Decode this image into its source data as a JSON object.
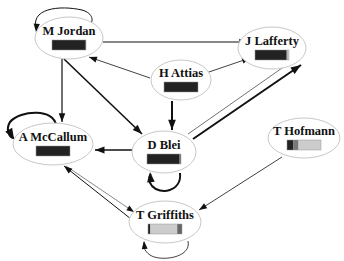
{
  "diagram": {
    "type": "directed-graph",
    "colors": {
      "node_fill": "#ffffff",
      "node_stroke": "#c8c8c8",
      "edge": "#111111",
      "bar_dark": "#222222",
      "bar_mid": "#666666",
      "bar_light": "#c8c8c8"
    },
    "nodes": [
      {
        "id": "jordan",
        "label": "M Jordan",
        "cx": 69,
        "cy": 38,
        "rx": 34,
        "ry": 21,
        "bar": [
          {
            "w": 0.97,
            "c": "#222222"
          },
          {
            "w": 0.03,
            "c": "#555555"
          }
        ]
      },
      {
        "id": "lafferty",
        "label": "J Lafferty",
        "cx": 272,
        "cy": 48,
        "rx": 34,
        "ry": 21,
        "bar": [
          {
            "w": 0.93,
            "c": "#222222"
          },
          {
            "w": 0.03,
            "c": "#777777"
          },
          {
            "w": 0.04,
            "c": "#cccccc"
          }
        ]
      },
      {
        "id": "attias",
        "label": "H Attias",
        "cx": 181,
        "cy": 80,
        "rx": 30,
        "ry": 20,
        "bar": [
          {
            "w": 1.0,
            "c": "#222222"
          }
        ]
      },
      {
        "id": "mccallum",
        "label": "A McCallum",
        "cx": 53,
        "cy": 144,
        "rx": 40,
        "ry": 21,
        "bar": [
          {
            "w": 1.0,
            "c": "#222222"
          }
        ]
      },
      {
        "id": "blei",
        "label": "D Blei",
        "cx": 164,
        "cy": 152,
        "rx": 32,
        "ry": 21,
        "bar": [
          {
            "w": 0.96,
            "c": "#222222"
          },
          {
            "w": 0.04,
            "c": "#777777"
          }
        ]
      },
      {
        "id": "hofmann",
        "label": "T Hofmann",
        "cx": 304,
        "cy": 138,
        "rx": 36,
        "ry": 20,
        "bar": [
          {
            "w": 0.18,
            "c": "#222222"
          },
          {
            "w": 0.16,
            "c": "#777777"
          },
          {
            "w": 0.66,
            "c": "#cccccc"
          }
        ]
      },
      {
        "id": "griffiths",
        "label": "T Griffiths",
        "cx": 165,
        "cy": 222,
        "rx": 36,
        "ry": 21,
        "bar": [
          {
            "w": 0.07,
            "c": "#222222"
          },
          {
            "w": 0.79,
            "c": "#cccccc"
          },
          {
            "w": 0.14,
            "c": "#666666"
          }
        ]
      }
    ],
    "edges": [
      {
        "from": "jordan",
        "to": "lafferty",
        "weight": 1.2,
        "d": "M103,42 L248,42",
        "arrow": [
          248,
          42,
          0
        ]
      },
      {
        "from": "jordan",
        "to": "mccallum",
        "weight": 1.2,
        "d": "M62,59 L62,122",
        "arrow": [
          62,
          122,
          90
        ]
      },
      {
        "from": "jordan",
        "to": "blei",
        "weight": 1.6,
        "d": "M64,59 L142,134",
        "arrow": [
          142,
          134,
          44
        ]
      },
      {
        "from": "attias",
        "to": "jordan",
        "weight": 0.8,
        "d": "M150,78 L89,57",
        "arrow": [
          89,
          57,
          199
        ]
      },
      {
        "from": "attias",
        "to": "lafferty",
        "weight": 0.8,
        "d": "M206,73 L250,58",
        "arrow": [
          250,
          58,
          -19
        ]
      },
      {
        "from": "attias",
        "to": "blei",
        "weight": 2.0,
        "d": "M172,101 L172,130",
        "arrow": [
          172,
          130,
          90
        ]
      },
      {
        "from": "blei",
        "to": "lafferty",
        "weight": 2.0,
        "d": "M193,139 L301,65",
        "arrow": [
          301,
          65,
          -34
        ]
      },
      {
        "from": "lafferty",
        "to": "blei",
        "weight": 0.6,
        "d": "M285,66 L188,134",
        "arrow": null
      },
      {
        "from": "blei",
        "to": "mccallum",
        "weight": 1.6,
        "d": "M132,150 L95,150",
        "arrow": [
          95,
          150,
          180
        ]
      },
      {
        "from": "griffiths",
        "to": "mccallum",
        "weight": 1.0,
        "d": "M131,219 L64,166",
        "arrow": [
          64,
          166,
          218
        ]
      },
      {
        "from": "mccallum",
        "to": "griffiths",
        "weight": 0.5,
        "d": "M66,166 L134,212",
        "arrow": [
          134,
          212,
          34
        ]
      },
      {
        "from": "hofmann",
        "to": "griffiths",
        "weight": 0.8,
        "d": "M282,157 L199,210",
        "arrow": [
          199,
          210,
          147
        ]
      }
    ],
    "self_loops": [
      {
        "node": "jordan",
        "weight": 1.0,
        "d": "M37,31 C28,8 60,5 82,10 C96,14 92,25 90,22",
        "arrow": [
          36,
          32,
          95
        ]
      },
      {
        "node": "mccallum",
        "weight": 2.2,
        "d": "M56,126 C55,108 20,110 10,122 C5,130 10,138 14,138",
        "arrow": [
          14,
          139,
          60
        ]
      },
      {
        "node": "blei",
        "weight": 2.0,
        "d": "M180,173 C182,192 160,195 152,186 C148,181 149,176 151,174",
        "arrow": [
          150,
          172,
          -95
        ]
      },
      {
        "node": "griffiths",
        "weight": 0.8,
        "d": "M188,241 C192,258 160,262 150,255 C143,250 143,245 144,242",
        "arrow": [
          144,
          241,
          -95
        ]
      }
    ]
  }
}
